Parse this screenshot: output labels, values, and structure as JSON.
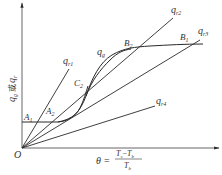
{
  "diagram": {
    "type": "heat-generation-vs-heat-removal",
    "axes": {
      "y_label": {
        "var1": "q",
        "sub1": "g",
        "connector": "或",
        "var2": "q",
        "sub2": "r"
      },
      "x_label": {
        "lhs": "θ",
        "eq": "=",
        "num_a": "T",
        "num_a_sub": "s",
        "minus": "−",
        "num_b": "T",
        "num_b_sub": "b",
        "den": "T",
        "den_sub": "b"
      },
      "origin": "O"
    },
    "lines": [
      {
        "id": "qr1",
        "var": "q",
        "sub": "r1"
      },
      {
        "id": "qr2",
        "var": "q",
        "sub": "r2"
      },
      {
        "id": "qr3",
        "var": "q",
        "sub": "r3"
      },
      {
        "id": "qr4",
        "var": "q",
        "sub": "r4"
      }
    ],
    "curve": {
      "var": "q",
      "sub": "g"
    },
    "points": [
      {
        "id": "A1",
        "letter": "A",
        "sub": "1"
      },
      {
        "id": "A2",
        "letter": "A",
        "sub": "2"
      },
      {
        "id": "C2",
        "letter": "C",
        "sub": "2"
      },
      {
        "id": "B2",
        "letter": "B",
        "sub": "2"
      },
      {
        "id": "B1",
        "letter": "B",
        "sub": "1"
      }
    ],
    "colors": {
      "stroke": "#2a2a2a",
      "text": "#333333",
      "background": "#ffffff"
    }
  }
}
